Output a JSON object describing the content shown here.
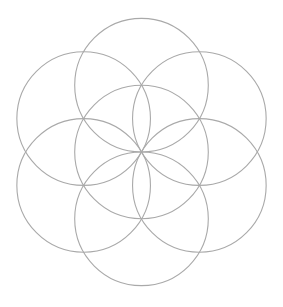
{
  "diagram": {
    "type": "seed-of-life",
    "background": "#ffffff",
    "stroke_color": "#a9a9a9",
    "center": {
      "x": 141.5,
      "y": 152
    },
    "radius": 66.8,
    "circle_count": 7,
    "circles": [
      {
        "name": "center",
        "angle_deg": null
      },
      {
        "name": "top",
        "angle_deg": -90
      },
      {
        "name": "top-right",
        "angle_deg": -30
      },
      {
        "name": "bottom-right",
        "angle_deg": 30
      },
      {
        "name": "bottom",
        "angle_deg": 90
      },
      {
        "name": "bottom-left",
        "angle_deg": 150
      },
      {
        "name": "top-left",
        "angle_deg": 210
      }
    ]
  }
}
